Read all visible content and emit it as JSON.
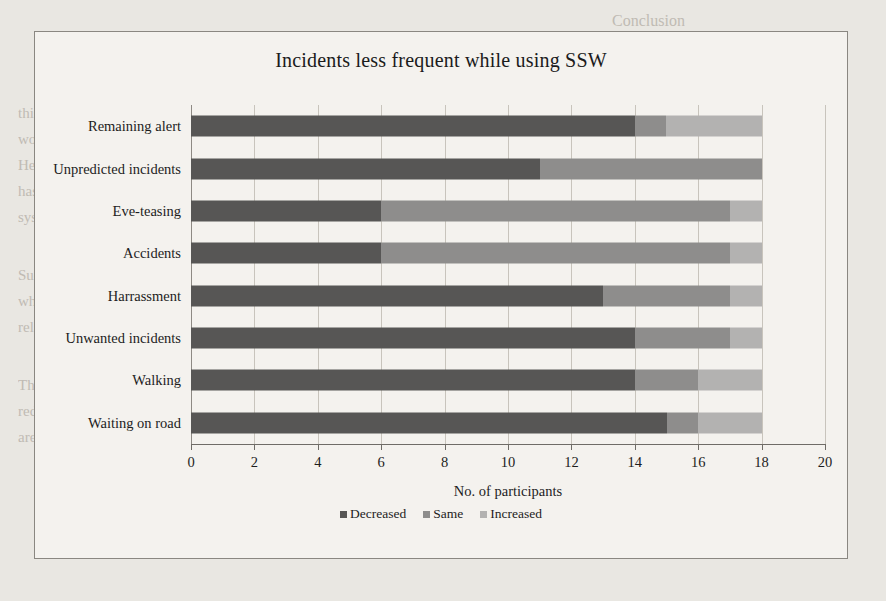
{
  "page": {
    "background_texts": [
      {
        "text": "Conclusion",
        "x": 612,
        "y": 8,
        "size": 16
      },
      {
        "text": "this respect. We talked about the need for designing a mass market device for all",
        "x": 18,
        "y": 100,
        "size": 15
      },
      {
        "text": "women. As we see, the participants hardly used the app and preferred using the device.",
        "x": 18,
        "y": 126,
        "size": 15
      },
      {
        "text": "Hence, while being in the situation of vulnerability, speed and being discreet",
        "x": 18,
        "y": 152,
        "size": 15
      },
      {
        "text": "has a much greater importance and therefore would be the key part if in the",
        "x": 18,
        "y": 178,
        "size": 15
      },
      {
        "text": "system.",
        "x": 18,
        "y": 204,
        "size": 15
      },
      {
        "text": "Such tools and products can increase the perception of safety and awareness",
        "x": 18,
        "y": 262,
        "size": 15
      },
      {
        "text": "while walking and commuting for women. Society also has a role in this with",
        "x": 18,
        "y": 288,
        "size": 15
      },
      {
        "text": "relatives and other people around.",
        "x": 18,
        "y": 314,
        "size": 15
      },
      {
        "text": "The situations can be avoided if people are more vigilant. The",
        "x": 18,
        "y": 372,
        "size": 15
      },
      {
        "text": "reduction in trial periods in eve-teasing reminds us that when these people",
        "x": 18,
        "y": 398,
        "size": 15
      },
      {
        "text": "are everywhere, then the safety is everywhere.",
        "x": 18,
        "y": 424,
        "size": 15
      }
    ]
  },
  "chart_data": {
    "type": "bar",
    "orientation": "horizontal",
    "stacked": true,
    "title": "Incidents less frequent while using SSW",
    "xlabel": "No. of participants",
    "ylabel": "",
    "xlim": [
      0,
      20
    ],
    "xticks": [
      0,
      2,
      4,
      6,
      8,
      10,
      12,
      14,
      16,
      18,
      20
    ],
    "grid": true,
    "legend_position": "bottom",
    "categories": [
      "Remaining alert",
      "Unpredicted incidents",
      "Eve-teasing",
      "Accidents",
      "Harrassment",
      "Unwanted incidents",
      "Walking",
      "Waiting on road"
    ],
    "series": [
      {
        "name": "Decreased",
        "color": "#575655",
        "values": [
          14,
          11,
          6,
          6,
          13,
          14,
          14,
          15
        ]
      },
      {
        "name": "Same",
        "color": "#8e8d8c",
        "values": [
          1,
          7,
          11,
          11,
          4,
          3,
          2,
          1
        ]
      },
      {
        "name": "Increased",
        "color": "#b3b2b1",
        "values": [
          3,
          0,
          1,
          1,
          1,
          1,
          2,
          2
        ]
      }
    ],
    "totals": [
      18,
      18,
      18,
      18,
      18,
      18,
      18,
      18
    ]
  }
}
